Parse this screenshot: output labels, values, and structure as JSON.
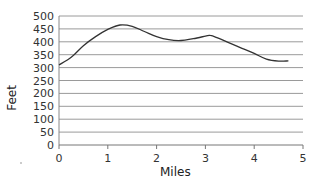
{
  "chart_data": {
    "type": "line",
    "title": "",
    "xlabel": "Miles",
    "ylabel": "Feet",
    "xlim": [
      0,
      5
    ],
    "ylim": [
      0,
      500
    ],
    "x_ticks": [
      0,
      1,
      2,
      3,
      4,
      5
    ],
    "y_ticks": [
      0,
      50,
      100,
      150,
      200,
      250,
      300,
      350,
      400,
      450,
      500
    ],
    "grid": {
      "horizontal": true,
      "vertical": false
    },
    "legend": null,
    "series": [
      {
        "name": "Elevation",
        "color": "#333333",
        "x": [
          0,
          0.25,
          0.5,
          0.75,
          1.0,
          1.25,
          1.5,
          1.75,
          2.0,
          2.25,
          2.5,
          2.75,
          3.0,
          3.1,
          3.25,
          3.5,
          3.75,
          4.0,
          4.25,
          4.5,
          4.7
        ],
        "y": [
          310,
          340,
          385,
          420,
          448,
          465,
          460,
          440,
          420,
          408,
          405,
          412,
          422,
          425,
          415,
          395,
          375,
          355,
          333,
          325,
          326
        ]
      }
    ]
  }
}
